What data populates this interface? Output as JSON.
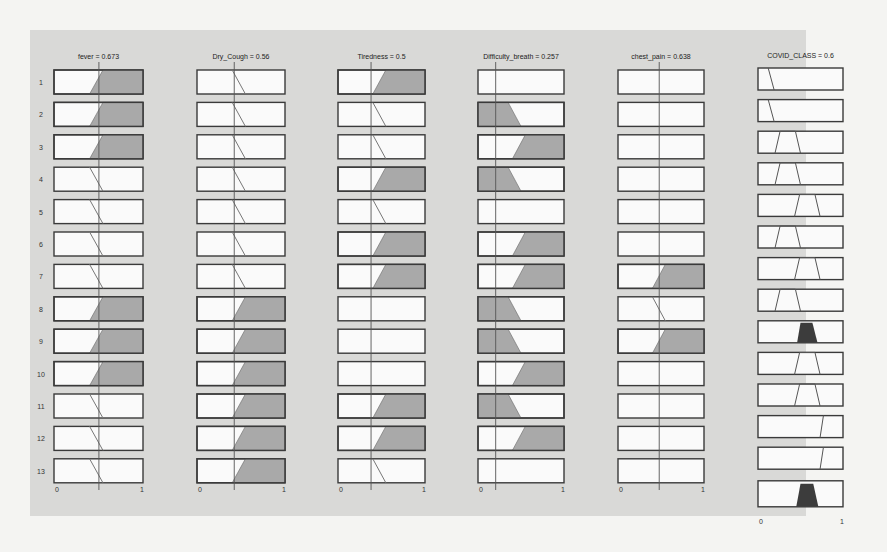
{
  "chart_data": {
    "type": "fuzzy-rule-viewer",
    "title": "",
    "inputs": [
      {
        "name": "fever",
        "value": 0.673,
        "title": "fever = 0.673"
      },
      {
        "name": "Dry_Cough",
        "value": 0.56,
        "title": "Dry_Cough = 0.56"
      },
      {
        "name": "Tiredness",
        "value": 0.5,
        "title": "Tiredness = 0.5"
      },
      {
        "name": "Difficulty_breath",
        "value": 0.257,
        "title": "Difficulty_breath = 0.257"
      },
      {
        "name": "chest_pain",
        "value": 0.638,
        "title": "chest_pain = 0.638"
      }
    ],
    "output": {
      "name": "COVID_CLASS",
      "value": 0.6,
      "title": "COVID_CLASS = 0.6"
    },
    "rows": [
      "1",
      "2",
      "3",
      "4",
      "5",
      "6",
      "7",
      "8",
      "9",
      "10",
      "11",
      "12",
      "13"
    ],
    "x_ticks": [
      "0",
      "1"
    ],
    "xlim": [
      0,
      1
    ],
    "mf_types_note": "high = rising ramp (filled when fired), low = falling ramp, none = empty",
    "rules": [
      {
        "fever": "high",
        "Dry_Cough": "low",
        "Tiredness": "high",
        "Difficulty_breath": "none",
        "chest_pain": "none",
        "COVID_CLASS": "very_low"
      },
      {
        "fever": "high",
        "Dry_Cough": "low",
        "Tiredness": "low",
        "Difficulty_breath": "low",
        "chest_pain": "none",
        "COVID_CLASS": "very_low"
      },
      {
        "fever": "high",
        "Dry_Cough": "low",
        "Tiredness": "low",
        "Difficulty_breath": "high",
        "chest_pain": "none",
        "COVID_CLASS": "low"
      },
      {
        "fever": "low",
        "Dry_Cough": "low",
        "Tiredness": "high",
        "Difficulty_breath": "low",
        "chest_pain": "none",
        "COVID_CLASS": "low"
      },
      {
        "fever": "low",
        "Dry_Cough": "low",
        "Tiredness": "low",
        "Difficulty_breath": "none",
        "chest_pain": "none",
        "COVID_CLASS": "medium"
      },
      {
        "fever": "low",
        "Dry_Cough": "low",
        "Tiredness": "high",
        "Difficulty_breath": "high",
        "chest_pain": "none",
        "COVID_CLASS": "low"
      },
      {
        "fever": "low",
        "Dry_Cough": "low",
        "Tiredness": "high",
        "Difficulty_breath": "high",
        "chest_pain": "high",
        "COVID_CLASS": "medium"
      },
      {
        "fever": "high",
        "Dry_Cough": "high",
        "Tiredness": "none",
        "Difficulty_breath": "low",
        "chest_pain": "low",
        "COVID_CLASS": "low"
      },
      {
        "fever": "high",
        "Dry_Cough": "high",
        "Tiredness": "none",
        "Difficulty_breath": "low",
        "chest_pain": "high",
        "COVID_CLASS": "medium_fired"
      },
      {
        "fever": "high",
        "Dry_Cough": "high",
        "Tiredness": "none",
        "Difficulty_breath": "high",
        "chest_pain": "none",
        "COVID_CLASS": "medium"
      },
      {
        "fever": "low",
        "Dry_Cough": "high",
        "Tiredness": "high",
        "Difficulty_breath": "low",
        "chest_pain": "none",
        "COVID_CLASS": "medium"
      },
      {
        "fever": "low",
        "Dry_Cough": "high",
        "Tiredness": "high",
        "Difficulty_breath": "high",
        "chest_pain": "none",
        "COVID_CLASS": "high"
      },
      {
        "fever": "low",
        "Dry_Cough": "high",
        "Tiredness": "low",
        "Difficulty_breath": "none",
        "chest_pain": "none",
        "COVID_CLASS": "high"
      }
    ],
    "aggregate_row": "COVID_CLASS aggregated output (filled trapezoid centered near 0.6)"
  },
  "labels": {
    "titles": [
      "fever = 0.673",
      "Dry_Cough = 0.56",
      "Tiredness = 0.5",
      "Difficulty_breath = 0.257",
      "chest_pain = 0.638",
      "COVID_CLASS = 0.6"
    ],
    "tick0": "0",
    "tick1": "1"
  },
  "colors": {
    "panel": "#d9d9d7",
    "box_fill": "#fafafa",
    "box_border": "#3a3a3a",
    "fired_fill": "#a9a9a9",
    "output_fired_fill": "#3c3c3c",
    "line": "#555555"
  }
}
